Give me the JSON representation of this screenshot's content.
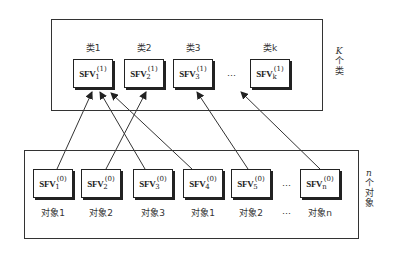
{
  "diagram": {
    "top_group": {
      "side_label": [
        "K",
        "个",
        "类"
      ],
      "labels": [
        "类1",
        "类2",
        "类3",
        "类k"
      ],
      "nodes": [
        {
          "base": "SFV",
          "sub": "1",
          "sup": "(1)"
        },
        {
          "base": "SFV",
          "sub": "2",
          "sup": "(1)"
        },
        {
          "base": "SFV",
          "sub": "3",
          "sup": "(1)"
        },
        {
          "base": "SFV",
          "sub": "k",
          "sup": "(1)"
        }
      ],
      "ellipsis": "…"
    },
    "bottom_group": {
      "side_label": [
        "n",
        "个",
        "对",
        "象"
      ],
      "labels": [
        "对象1",
        "对象2",
        "对象3",
        "对象1",
        "对象2",
        "…",
        "对象n"
      ],
      "nodes": [
        {
          "base": "SFV",
          "sub": "1",
          "sup": "(0)"
        },
        {
          "base": "SFV",
          "sub": "2",
          "sup": "(0)"
        },
        {
          "base": "SFV",
          "sub": "3",
          "sup": "(0)"
        },
        {
          "base": "SFV",
          "sub": "4",
          "sup": "(0)"
        },
        {
          "base": "SFV",
          "sub": "5",
          "sup": "(0)"
        },
        {
          "base": "SFV",
          "sub": "n",
          "sup": "(0)"
        }
      ],
      "ellipsis": "…"
    },
    "edges": [
      {
        "from": "SFV1(0)",
        "to": "SFV1(1)"
      },
      {
        "from": "SFV2(0)",
        "to": "SFV2(1)"
      },
      {
        "from": "SFV3(0)",
        "to": "SFV1(1)"
      },
      {
        "from": "SFV4(0)",
        "to": "SFV1(1)"
      },
      {
        "from": "SFV5(0)",
        "to": "SFV3(1)"
      },
      {
        "from": "SFVn(0)",
        "to": "SFVk(1)"
      }
    ]
  }
}
